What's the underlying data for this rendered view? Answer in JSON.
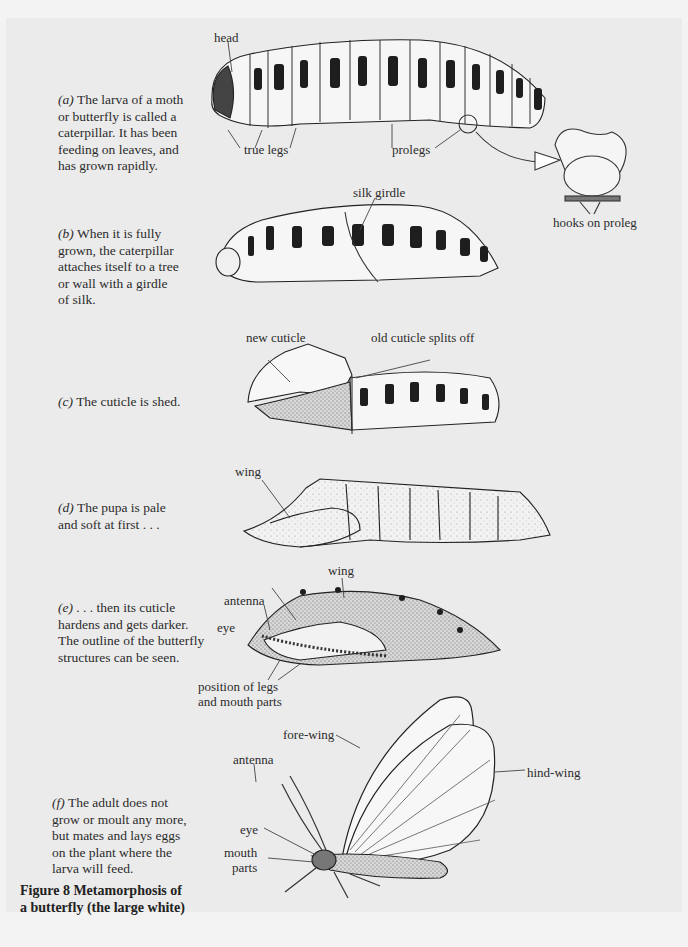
{
  "figure": {
    "number": "Figure 8",
    "title_line1": "Figure 8   Metamorphosis of",
    "title_line2": "a butterfly (the large white)"
  },
  "stages": [
    {
      "id": "a",
      "marker": "(a)",
      "lines": [
        "The larva of a moth",
        "or butterfly is called a",
        "caterpillar. It has been",
        "feeding on leaves, and",
        "has grown rapidly."
      ],
      "labels": {
        "head": "head",
        "true_legs": "true legs",
        "prolegs": "prolegs",
        "hooks": "hooks on proleg"
      }
    },
    {
      "id": "b",
      "marker": "(b)",
      "lines": [
        "When it is fully",
        "grown, the caterpillar",
        "attaches itself to a tree",
        "or wall with a girdle",
        "of silk."
      ],
      "labels": {
        "silk_girdle": "silk girdle"
      }
    },
    {
      "id": "c",
      "marker": "(c)",
      "lines": [
        "The cuticle is shed."
      ],
      "labels": {
        "new_cuticle": "new cuticle",
        "old_cuticle": "old cuticle splits off"
      }
    },
    {
      "id": "d",
      "marker": "(d)",
      "lines": [
        "The pupa is pale",
        "and soft at first . . ."
      ],
      "labels": {
        "wing": "wing"
      }
    },
    {
      "id": "e",
      "marker": "(e)",
      "lines": [
        ". . . then its cuticle",
        "hardens and gets darker.",
        "The outline of the butterfly",
        "structures can be seen."
      ],
      "labels": {
        "wing": "wing",
        "antenna": "antenna",
        "eye": "eye",
        "legs_1": "position of legs",
        "legs_2": "and mouth parts"
      }
    },
    {
      "id": "f",
      "marker": "(f)",
      "lines": [
        "The adult does not",
        "grow or moult any more,",
        "but mates and lays eggs",
        "on the plant where the",
        "larva will feed."
      ],
      "labels": {
        "fore_wing": "fore-wing",
        "hind_wing": "hind-wing",
        "antenna": "antenna",
        "eye": "eye",
        "mouth_1": "mouth",
        "mouth_2": "parts"
      }
    }
  ],
  "colors": {
    "panel": "#ebebeb",
    "ink": "#2b2b2b",
    "body_fill": "#f5f5f5",
    "spots": "#1e1e1e"
  }
}
